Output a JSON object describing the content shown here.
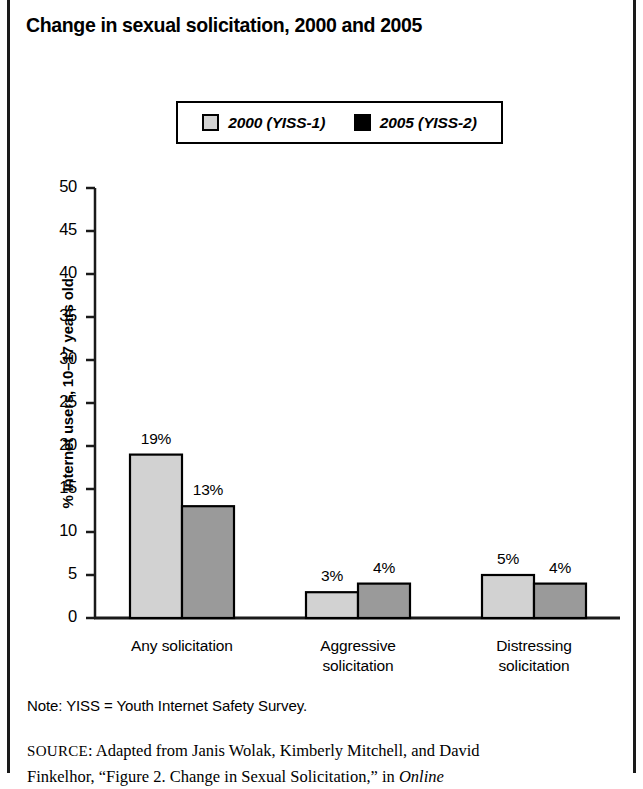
{
  "figure": {
    "title": "Change in sexual solicitation, 2000 and 2005",
    "note": "Note: YISS = Youth Internet Safety Survey.",
    "source_prefix": "SOURCE",
    "source_sep": ": ",
    "source_line1": "Adapted from Janis Wolak, Kimberly Mitchell, and David",
    "source_line2_a": "Finkelhor, “Figure 2. Change in Sexual Solicitation,” in ",
    "source_line2_italic": "Online"
  },
  "legend": {
    "position": "top-center",
    "items": [
      {
        "label": "2000 (YISS-1)",
        "color": "#d2d2d2",
        "name": "legend-swatch-2000"
      },
      {
        "label": "2005 (YISS-2)",
        "color": "#000000",
        "name": "legend-swatch-2005"
      }
    ]
  },
  "chart_data": {
    "type": "bar",
    "title": "Change in sexual solicitation, 2000 and 2005",
    "xlabel": "",
    "ylabel": "% Internet users, 10–17 years old",
    "ylim": [
      0,
      50
    ],
    "yticks": [
      0,
      5,
      10,
      15,
      20,
      25,
      30,
      35,
      40,
      45,
      50
    ],
    "ytick_labels": [
      "0",
      "5",
      "10",
      "15",
      "20",
      "25",
      "30",
      "35",
      "40",
      "45",
      "50"
    ],
    "grid": false,
    "categories": [
      "Any solicitation",
      "Aggressive solicitation",
      "Distressing solicitation"
    ],
    "category_lines": [
      [
        "Any solicitation"
      ],
      [
        "Aggressive",
        "solicitation"
      ],
      [
        "Distressing",
        "solicitation"
      ]
    ],
    "series": [
      {
        "name": "2000 (YISS-1)",
        "values": [
          19,
          3,
          5
        ],
        "value_labels": [
          "19%",
          "3%",
          "5%"
        ],
        "fill": "#d2d2d2",
        "stroke": "#000000"
      },
      {
        "name": "2005 (YISS-2)",
        "values": [
          13,
          4,
          4
        ],
        "value_labels": [
          "13%",
          "4%",
          "4%"
        ],
        "fill": "#9a9a9a",
        "stroke": "#000000"
      }
    ]
  },
  "geometry": {
    "axis_x": 95,
    "baseline_y": 618,
    "top_y": 188,
    "axis_right": 620,
    "px_per_unit": 8.6,
    "bar_width": 52,
    "group_starts": [
      130,
      306,
      482
    ]
  }
}
